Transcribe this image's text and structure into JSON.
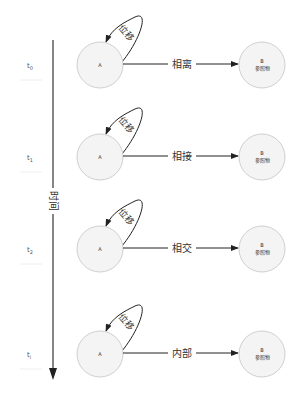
{
  "timeline": {
    "axis_label": "时间",
    "direction": "down"
  },
  "rows": [
    {
      "time": "t",
      "sub": "0",
      "source": "A",
      "relation": "相离",
      "target_letter": "B",
      "target_label": "参照物",
      "loop_label": "位移"
    },
    {
      "time": "t",
      "sub": "1",
      "source": "A",
      "relation": "相接",
      "target_letter": "B",
      "target_label": "参照物",
      "loop_label": "位移"
    },
    {
      "time": "t",
      "sub": "2",
      "source": "A",
      "relation": "相交",
      "target_letter": "B",
      "target_label": "参照物",
      "loop_label": "位移"
    },
    {
      "time": "t",
      "sub": "i",
      "source": "A",
      "relation": "内部",
      "target_letter": "B",
      "target_label": "参照物",
      "loop_label": "位移"
    }
  ],
  "colors": {
    "node_fill": "#f4f4f4",
    "node_stroke": "#cfcfcf",
    "edge": "#222222"
  }
}
